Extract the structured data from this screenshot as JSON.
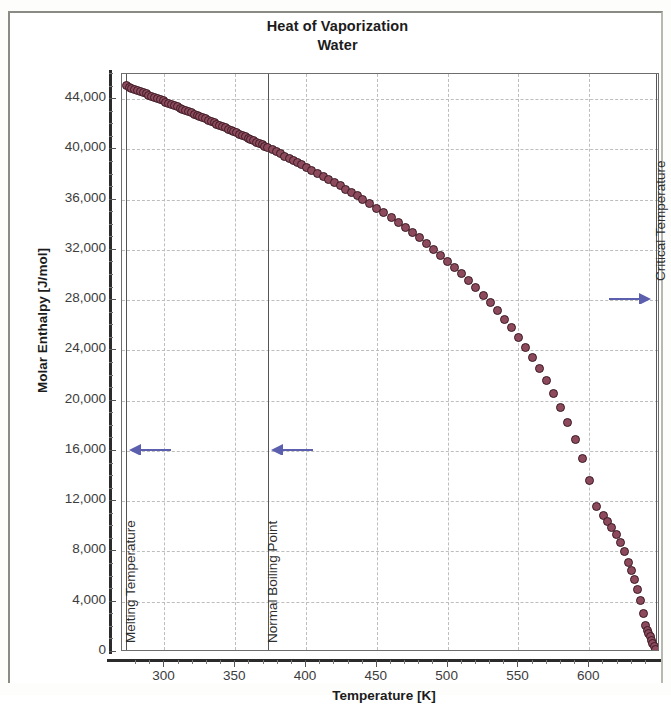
{
  "chart_data": {
    "type": "scatter",
    "title": "Heat of Vaporization",
    "subtitle": "Water",
    "xlabel": "Temperature [K]",
    "ylabel": "Molar Enthalpy [J/mol]",
    "xlim": [
      270,
      650
    ],
    "ylim": [
      0,
      46000
    ],
    "x_ticks": [
      300,
      350,
      400,
      450,
      500,
      550,
      600
    ],
    "x_tick_labels": [
      "300",
      "350",
      "400",
      "450",
      "500",
      "550",
      "600"
    ],
    "x_minor_step": 10,
    "y_ticks": [
      0,
      4000,
      8000,
      12000,
      16000,
      20000,
      24000,
      28000,
      32000,
      36000,
      40000,
      44000
    ],
    "y_tick_labels": [
      "0",
      "4,000",
      "8,000",
      "12,000",
      "16,000",
      "20,000",
      "24,000",
      "28,000",
      "32,000",
      "36,000",
      "40,000",
      "44,000"
    ],
    "grid": "dashed-both",
    "legend": "none",
    "marker_color": "#8e4a5d",
    "marker_edge_color": "#3a1a24",
    "marker_shape": "circle",
    "annotation_color": "#5b5fae",
    "series": [
      {
        "name": "Molar Enthalpy of Vaporization",
        "x": [
          273,
          275,
          277,
          279,
          281,
          283,
          285,
          287,
          289,
          291,
          293,
          295,
          297,
          299,
          301,
          303,
          305,
          307,
          309,
          311,
          313,
          315,
          317,
          319,
          321,
          323,
          325,
          327,
          329,
          331,
          333,
          335,
          337,
          339,
          341,
          343,
          345,
          347,
          349,
          351,
          353,
          355,
          357,
          359,
          361,
          363,
          365,
          367,
          369,
          371,
          373,
          376,
          379,
          382,
          385,
          388,
          391,
          394,
          397,
          400,
          404,
          408,
          412,
          416,
          420,
          424,
          428,
          432,
          436,
          440,
          445,
          450,
          455,
          460,
          465,
          470,
          475,
          480,
          485,
          490,
          495,
          500,
          505,
          510,
          515,
          520,
          525,
          530,
          535,
          540,
          545,
          550,
          555,
          560,
          565,
          570,
          575,
          580,
          585,
          590,
          595,
          600,
          605,
          610,
          613,
          616,
          619,
          622,
          625,
          628,
          630,
          632,
          634,
          636,
          638,
          640,
          641,
          642,
          643,
          644,
          645,
          646,
          647
        ],
        "y": [
          45050,
          44960,
          44870,
          44780,
          44690,
          44600,
          44500,
          44410,
          44320,
          44230,
          44140,
          44040,
          43950,
          43860,
          43760,
          43670,
          43580,
          43480,
          43390,
          43290,
          43200,
          43100,
          43000,
          42910,
          42810,
          42710,
          42620,
          42520,
          42420,
          42320,
          42220,
          42120,
          42020,
          41920,
          41820,
          41720,
          41620,
          41520,
          41420,
          41310,
          41210,
          41110,
          41000,
          40900,
          40790,
          40690,
          40580,
          40470,
          40370,
          40260,
          40150,
          39980,
          39810,
          39640,
          39470,
          39300,
          39120,
          38950,
          38770,
          38590,
          38350,
          38110,
          37860,
          37610,
          37360,
          37100,
          36840,
          36580,
          36310,
          36030,
          35680,
          35320,
          34950,
          34570,
          34180,
          33780,
          33370,
          32950,
          32510,
          32060,
          31590,
          31110,
          30610,
          30090,
          29550,
          28990,
          28410,
          27800,
          27160,
          26490,
          25790,
          25050,
          24270,
          23430,
          22540,
          21590,
          20560,
          19450,
          18230,
          16890,
          15380,
          13650,
          11600,
          10900,
          10400,
          9900,
          9350,
          8700,
          8000,
          7150,
          6500,
          5800,
          5000,
          4100,
          3100,
          2100,
          1750,
          1450,
          1200,
          950,
          700,
          450,
          200
        ]
      }
    ],
    "annotations": [
      {
        "id": "melting-temperature",
        "label": "Melting Temperature",
        "x": 273.15,
        "arrow_direction": "left",
        "arrow_y_value": 16000
      },
      {
        "id": "normal-boiling-point",
        "label": "Normal Boiling Point",
        "x": 373.15,
        "arrow_direction": "left",
        "arrow_y_value": 16000
      },
      {
        "id": "critical-temperature",
        "label": "Critical Temperature",
        "x": 647.1,
        "arrow_direction": "right",
        "arrow_y_value": 28000
      }
    ]
  }
}
